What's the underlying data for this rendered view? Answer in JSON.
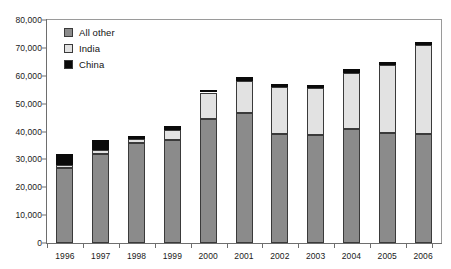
{
  "chart_data": {
    "type": "bar",
    "barmode": "stacked",
    "title": "",
    "xlabel": "",
    "ylabel": "",
    "ylim": [
      0,
      80000
    ],
    "ytick_interval": 10000,
    "ytick_labels": [
      "0",
      "10,000",
      "20,000",
      "30,000",
      "40,000",
      "50,000",
      "60,000",
      "70,000",
      "80,000"
    ],
    "ytick_values": [
      0,
      10000,
      20000,
      30000,
      40000,
      50000,
      60000,
      70000,
      80000
    ],
    "grid": false,
    "legend_position": "top-left",
    "categories": [
      "1996",
      "1997",
      "1998",
      "1999",
      "2000",
      "2001",
      "2002",
      "2003",
      "2004",
      "2005",
      "2006"
    ],
    "series": [
      {
        "name": "All other",
        "color": "#8b8b8b",
        "values": [
          27000,
          32000,
          36000,
          36800,
          44500,
          46500,
          39000,
          38700,
          41000,
          39500,
          39000
        ]
      },
      {
        "name": "India",
        "color": "#e2e2e2",
        "values": [
          900,
          1200,
          1300,
          3800,
          9500,
          11800,
          17000,
          17000,
          20000,
          24500,
          32000
        ]
      },
      {
        "name": "China",
        "color": "#0a0a0a",
        "values": [
          4100,
          3800,
          1200,
          1400,
          1000,
          1200,
          1000,
          1100,
          1500,
          1000,
          1000
        ]
      }
    ],
    "totals": [
      32000,
      37000,
      38500,
      42000,
      55000,
      59500,
      57000,
      56800,
      62500,
      65000,
      72000
    ]
  },
  "legend": {
    "items": [
      {
        "label": "All other",
        "swatch": "#8b8b8b"
      },
      {
        "label": "India",
        "swatch": "#e2e2e2"
      },
      {
        "label": "China",
        "swatch": "#0a0a0a"
      }
    ]
  }
}
